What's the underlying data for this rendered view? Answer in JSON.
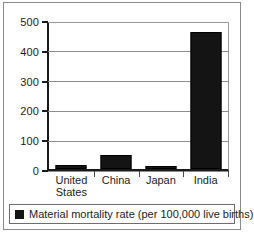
{
  "chart_data": {
    "type": "bar",
    "title": "",
    "xlabel": "",
    "ylabel": "",
    "categories": [
      "United States",
      "China",
      "Japan",
      "India"
    ],
    "category_lines": [
      [
        "United",
        "States"
      ],
      [
        "China"
      ],
      [
        "Japan"
      ],
      [
        "India"
      ]
    ],
    "values": [
      14,
      48,
      8,
      460
    ],
    "series": [
      {
        "name": "Material mortality rate (per 100,000 live births)",
        "values": [
          14,
          48,
          8,
          460
        ]
      }
    ],
    "ylim": [
      0,
      500
    ],
    "yticks": [
      0,
      100,
      200,
      300,
      400,
      500
    ],
    "ytick_labels": [
      "0",
      "100",
      "200",
      "300",
      "400",
      "500"
    ],
    "grid": true,
    "grid_axis": "y",
    "legend_position": "bottom",
    "legend": [
      {
        "label": "Material mortality rate (per 100,000 live births)",
        "color": "#141414",
        "marker": "square"
      }
    ],
    "colors": {
      "bar": "#141414",
      "gridline": "#8e8e8e",
      "axis": "#1a1a1a",
      "text": "#1d1d1d",
      "background": "#ffffff",
      "border": "#8a8a8a"
    }
  }
}
